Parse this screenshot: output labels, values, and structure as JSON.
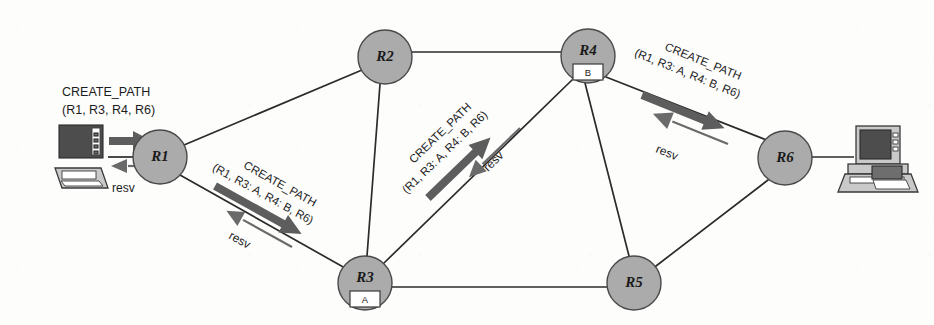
{
  "figure": {
    "background_color": "#fdfdfc",
    "node_fill_color": "#ababab",
    "node_stroke_color": "#4a4a4a",
    "edge_color": "#2b2b2b",
    "arrow_color": "#5d5d5d"
  },
  "nodes": [
    {
      "id": "R1",
      "label": "R1",
      "cx": 160,
      "cy": 157,
      "r": 27,
      "sub_box": null
    },
    {
      "id": "R2",
      "label": "R2",
      "cx": 385,
      "cy": 57,
      "r": 27,
      "sub_box": null
    },
    {
      "id": "R3",
      "label": "R3",
      "cx": 365,
      "cy": 283,
      "r": 27,
      "sub_box": "A"
    },
    {
      "id": "R4",
      "label": "R4",
      "cx": 588,
      "cy": 56,
      "r": 27,
      "sub_box": "B"
    },
    {
      "id": "R5",
      "label": "R5",
      "cx": 634,
      "cy": 283,
      "r": 27,
      "sub_box": null
    },
    {
      "id": "R6",
      "label": "R6",
      "cx": 785,
      "cy": 158,
      "r": 27,
      "sub_box": null
    }
  ],
  "edges": [
    {
      "from": "R1",
      "to": "R2"
    },
    {
      "from": "R1",
      "to": "R3"
    },
    {
      "from": "R2",
      "to": "R3"
    },
    {
      "from": "R2",
      "to": "R4"
    },
    {
      "from": "R3",
      "to": "R4"
    },
    {
      "from": "R3",
      "to": "R5"
    },
    {
      "from": "R4",
      "to": "R5"
    },
    {
      "from": "R5",
      "to": "R6"
    },
    {
      "from": "R4",
      "to": "R6"
    }
  ],
  "hosts": [
    {
      "id": "host-left",
      "side": "left",
      "x": 58,
      "y": 122,
      "connects_to": "R1"
    },
    {
      "id": "host-right",
      "side": "right",
      "x": 846,
      "y": 122,
      "connects_to": "R6"
    }
  ],
  "messages": [
    {
      "id": "msg-host-r1",
      "name": "create-path-host-to-r1",
      "line1": "CREATE_PATH",
      "line2": "(R1, R3, R4, R6)",
      "direction": "forward",
      "reverse_label": "resv",
      "segment": "host-left -> R1"
    },
    {
      "id": "msg-r1-r3",
      "name": "create-path-r1-to-r3",
      "line1": "CREATE_PATH",
      "line2": "(R1, R3: A, R4: B, R6)",
      "direction": "forward",
      "reverse_label": "resv",
      "segment": "R1 -> R3"
    },
    {
      "id": "msg-r3-r4",
      "name": "create-path-r3-to-r4",
      "line1": "CREATE_PATH",
      "line2": "(R1, R3: A, R4: B, R6)",
      "direction": "forward",
      "reverse_label": "resv",
      "segment": "R3 -> R4"
    },
    {
      "id": "msg-r4-r6",
      "name": "create-path-r4-to-r6",
      "line1": "CREATE_PATH",
      "line2": "(R1, R3: A, R4: B, R6)",
      "direction": "forward",
      "reverse_label": "resv",
      "segment": "R4 -> R6"
    }
  ]
}
